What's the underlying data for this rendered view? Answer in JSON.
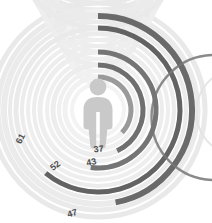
{
  "chart_data": {
    "type": "pie",
    "subtype": "radial-bar",
    "title": "",
    "subtitle": "",
    "xlabel": "",
    "ylabel": "",
    "grid": false,
    "legend_position": "none",
    "value_max": 100,
    "units": "%",
    "sweep_direction": "clockwise",
    "start_angle_deg": 0,
    "center_icon": "person-icon",
    "categories": [
      "37",
      "43",
      "47",
      "52",
      "61"
    ],
    "values": [
      37,
      43,
      47,
      52,
      61
    ],
    "series": [
      {
        "name": "radial-values",
        "values": [
          37,
          43,
          47,
          52,
          61
        ]
      }
    ],
    "rings": [
      {
        "label": "37",
        "value": 37,
        "radius_px": 33,
        "stroke_width_px": 5,
        "value_color": "#9a9a9a",
        "track_color": "#f1f1f1",
        "label_x": 99,
        "label_y": 152,
        "label_rotation_deg": -7
      },
      {
        "label": "43",
        "value": 43,
        "radius_px": 45,
        "stroke_width_px": 5,
        "value_color": "#6f6f6f",
        "track_color": "#ededed",
        "label_x": 92,
        "label_y": 165,
        "label_rotation_deg": -12
      },
      {
        "label": "47",
        "value": 47,
        "radius_px": 94,
        "stroke_width_px": 6,
        "value_color": "#6a6a6a",
        "track_color": "#ebebeb",
        "label_x": 73,
        "label_y": 216,
        "label_rotation_deg": -16
      },
      {
        "label": "52",
        "value": 52,
        "radius_px": 58,
        "stroke_width_px": 5,
        "value_color": "#757575",
        "track_color": "#eeeeee",
        "label_x": 57,
        "label_y": 168,
        "label_rotation_deg": -38
      },
      {
        "label": "61",
        "value": 61,
        "radius_px": 82,
        "stroke_width_px": 5,
        "value_color": "#636363",
        "track_color": "#eaeaea",
        "label_x": 23,
        "label_y": 140,
        "label_rotation_deg": -62
      }
    ],
    "extra_tracks": [
      {
        "radius_px": 26,
        "stroke_width_px": 4,
        "track_color": "#f3f3f3"
      },
      {
        "radius_px": 39,
        "stroke_width_px": 4,
        "track_color": "#f0f0f0"
      },
      {
        "radius_px": 51,
        "stroke_width_px": 4,
        "track_color": "#efefef"
      },
      {
        "radius_px": 64,
        "stroke_width_px": 4,
        "track_color": "#ededed"
      },
      {
        "radius_px": 70,
        "stroke_width_px": 4,
        "track_color": "#eeeeee"
      },
      {
        "radius_px": 76,
        "stroke_width_px": 4,
        "track_color": "#ececec"
      },
      {
        "radius_px": 88,
        "stroke_width_px": 4,
        "track_color": "#ebebeb"
      },
      {
        "radius_px": 100,
        "stroke_width_px": 5,
        "track_color": "#eaeaea"
      },
      {
        "radius_px": 107,
        "stroke_width_px": 5,
        "track_color": "#e9e9e9"
      }
    ],
    "center": {
      "cx": 98,
      "cy": 110
    },
    "neighbor_chart_arc": {
      "present": true,
      "color": "#6e6e6e",
      "description": "partial edge of adjacent radial chart"
    },
    "colors": {
      "background": "#ffffff",
      "icon": "#c9c9c9",
      "label_text": "#4c4c4c",
      "dark_ring": "#6a6a6a",
      "light_track": "#eeeeee"
    }
  }
}
